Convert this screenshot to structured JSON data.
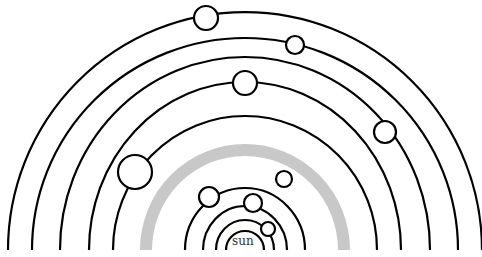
{
  "diagram": {
    "title": "",
    "sun_label": "sun",
    "colors": {
      "orbit": "#000000",
      "asteroid_belt": "#c8c8c8",
      "planet_fill": "#ffffff",
      "background": "#ffffff"
    },
    "center": {
      "x": 245,
      "y": 250
    },
    "orbits": [
      {
        "name": "orbit-1",
        "rx": 19,
        "ry": 19
      },
      {
        "name": "orbit-2",
        "rx": 29,
        "ry": 30
      },
      {
        "name": "orbit-3",
        "rx": 42,
        "ry": 44
      },
      {
        "name": "orbit-4",
        "rx": 60,
        "ry": 62
      },
      {
        "name": "asteroid-belt",
        "rx": 99,
        "ry": 100,
        "belt": true
      },
      {
        "name": "orbit-5",
        "rx": 132,
        "ry": 134
      },
      {
        "name": "orbit-6",
        "rx": 156,
        "ry": 168
      },
      {
        "name": "orbit-7",
        "rx": 185,
        "ry": 193
      },
      {
        "name": "orbit-8",
        "rx": 213,
        "ry": 212
      },
      {
        "name": "orbit-9",
        "rx": 237,
        "ry": 238
      }
    ],
    "planets": [
      {
        "name": "planet-1",
        "cx": 268,
        "cy": 229,
        "r": 7
      },
      {
        "name": "planet-2",
        "cx": 253,
        "cy": 203,
        "r": 9
      },
      {
        "name": "planet-3",
        "cx": 209,
        "cy": 197,
        "r": 10
      },
      {
        "name": "planet-4",
        "cx": 284,
        "cy": 179,
        "r": 8
      },
      {
        "name": "planet-5",
        "cx": 135,
        "cy": 172,
        "r": 17
      },
      {
        "name": "planet-6",
        "cx": 385,
        "cy": 132,
        "r": 11
      },
      {
        "name": "planet-7",
        "cx": 245,
        "cy": 83,
        "r": 12
      },
      {
        "name": "planet-8",
        "cx": 295,
        "cy": 45,
        "r": 9
      },
      {
        "name": "planet-9",
        "cx": 206,
        "cy": 18,
        "r": 12
      }
    ]
  }
}
